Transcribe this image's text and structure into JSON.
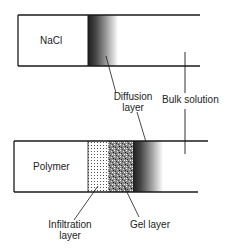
{
  "diagram": {
    "top_panel": {
      "solid_label": "NaCl",
      "diffusion_label_line1": "Diffusion",
      "diffusion_label_line2": "layer",
      "bulk_label": "Bulk solution"
    },
    "bottom_panel": {
      "solid_label": "Polymer",
      "infiltration_label_line1": "Infiltration",
      "infiltration_label_line2": "layer",
      "gel_label": "Gel layer"
    },
    "colors": {
      "line": "#1a1a1a",
      "gradient_dark": "#2a2a2a",
      "gradient_light": "#ffffff"
    }
  }
}
